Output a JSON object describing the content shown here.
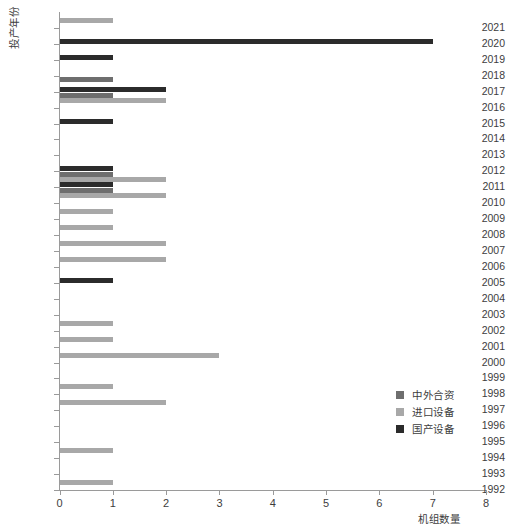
{
  "chart_data": {
    "type": "bar",
    "orientation": "horizontal",
    "title": "",
    "xlabel": "机组数量",
    "ylabel": "投产年份",
    "xlim": [
      0,
      8
    ],
    "xticks": [
      "0",
      "1",
      "2",
      "3",
      "4",
      "5",
      "6",
      "7",
      "8"
    ],
    "grid": false,
    "legend_position": "center-right",
    "categories": [
      "2021",
      "2020",
      "2019",
      "2018",
      "2017",
      "2016",
      "2015",
      "2014",
      "2013",
      "2012",
      "2011",
      "2010",
      "2009",
      "2008",
      "2007",
      "2006",
      "2005",
      "2004",
      "2003",
      "2002",
      "2001",
      "2000",
      "1999",
      "1998",
      "1997",
      "1996",
      "1995",
      "1994",
      "1993",
      "1992"
    ],
    "series": [
      {
        "name": "中外合资",
        "color": "#6e6e6e",
        "values": [
          0,
          0,
          0,
          0,
          1,
          1,
          0,
          0,
          0,
          0,
          1,
          1,
          0,
          0,
          0,
          0,
          0,
          0,
          0,
          0,
          0,
          0,
          0,
          0,
          0,
          0,
          0,
          0,
          0,
          0
        ]
      },
      {
        "name": "进口设备",
        "color": "#a8a8a8",
        "values": [
          1,
          0,
          0,
          0,
          0,
          2,
          0,
          0,
          0,
          0,
          2,
          2,
          1,
          1,
          2,
          2,
          0,
          0,
          0,
          1,
          1,
          3,
          0,
          1,
          2,
          0,
          0,
          1,
          0,
          1
        ]
      },
      {
        "name": "国产设备",
        "color": "#2b2b2b",
        "values": [
          0,
          7,
          1,
          0,
          2,
          0,
          1,
          0,
          0,
          1,
          1,
          0,
          0,
          0,
          0,
          0,
          1,
          0,
          0,
          0,
          0,
          0,
          0,
          0,
          0,
          0,
          0,
          0,
          0,
          0
        ]
      }
    ]
  },
  "legend": {
    "items": [
      {
        "label": "中外合资",
        "color": "#6e6e6e"
      },
      {
        "label": "进口设备",
        "color": "#a8a8a8"
      },
      {
        "label": "国产设备",
        "color": "#2b2b2b"
      }
    ]
  },
  "axes": {
    "x_title": "机组数量",
    "y_title": "投产年份"
  }
}
